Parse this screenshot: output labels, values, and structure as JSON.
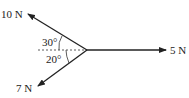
{
  "diagram": {
    "type": "force-diagram",
    "forces": [
      {
        "label": "10 N",
        "direction": "upper-left",
        "angle_from_horizontal_deg": 30
      },
      {
        "label": "5 N",
        "direction": "right",
        "angle_from_horizontal_deg": 0
      },
      {
        "label": "7 N",
        "direction": "lower-left",
        "angle_from_horizontal_deg": 20
      }
    ],
    "angles": [
      {
        "label": "30°"
      },
      {
        "label": "20°"
      }
    ]
  }
}
